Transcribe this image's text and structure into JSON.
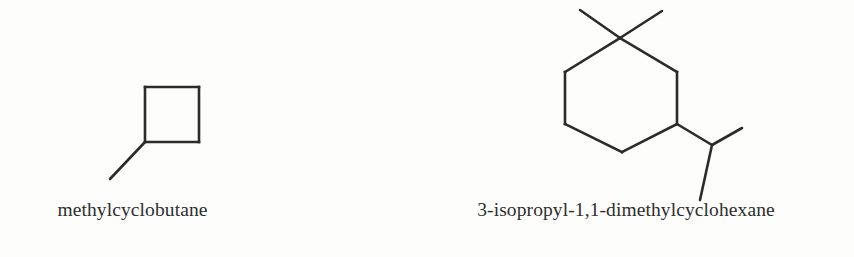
{
  "figure": {
    "background_color": "#fdfdfb",
    "bond_color": "#2b2b2b",
    "text_color": "#2e2e2e",
    "type": "skeletal-structure-diagram",
    "compound_count": 2
  },
  "compounds": [
    {
      "id": "methylcyclobutane",
      "caption": "methylcyclobutane",
      "ring": "cyclobutane",
      "ring_size": 4,
      "substituents": [
        "methyl"
      ],
      "bond_color": "#2b2b2b",
      "bond_width": 2.6,
      "ring_vertices": [
        [
          145,
          87
        ],
        [
          199,
          87
        ],
        [
          199,
          142
        ],
        [
          145,
          142
        ]
      ],
      "substituent_bonds": [
        {
          "name": "methyl",
          "from": [
            145,
            142
          ],
          "to": [
            110,
            179
          ]
        }
      ]
    },
    {
      "id": "dimethylcyclohexane",
      "caption": "3-isopropyl-1,1-dimethylcyclohexane",
      "ring": "cyclohexane",
      "ring_size": 6,
      "substituents": [
        "methyl",
        "methyl",
        "isopropyl"
      ],
      "bond_color": "#2b2b2b",
      "bond_width": 2.6,
      "ring_vertices": [
        [
          620,
          38
        ],
        [
          677,
          72
        ],
        [
          677,
          124
        ],
        [
          622,
          152
        ],
        [
          565,
          124
        ],
        [
          565,
          72
        ]
      ],
      "substituent_bonds": [
        {
          "name": "methyl-left",
          "from": [
            620,
            38
          ],
          "to": [
            580,
            10
          ]
        },
        {
          "name": "methyl-right",
          "from": [
            620,
            38
          ],
          "to": [
            662,
            11
          ]
        },
        {
          "name": "isopropyl-stem",
          "from": [
            677,
            124
          ],
          "to": [
            712,
            145
          ]
        },
        {
          "name": "isopropyl-methyl-up",
          "from": [
            712,
            145
          ],
          "to": [
            742,
            128
          ]
        },
        {
          "name": "isopropyl-methyl-down",
          "from": [
            712,
            145
          ],
          "to": [
            700,
            200
          ]
        }
      ]
    }
  ]
}
